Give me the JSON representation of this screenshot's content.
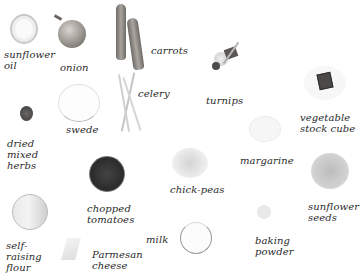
{
  "ingredients": [
    {
      "id": "sunflower-oil",
      "label": "sunflower\noil"
    },
    {
      "id": "onion",
      "label": "onion"
    },
    {
      "id": "carrots",
      "label": "carrots"
    },
    {
      "id": "turnips",
      "label": "turnips"
    },
    {
      "id": "celery",
      "label": "celery"
    },
    {
      "id": "vegetable-stock-cube",
      "label": "vegetable\nstock cube"
    },
    {
      "id": "swede",
      "label": "swede"
    },
    {
      "id": "dried-mixed-herbs",
      "label": "dried\nmixed\nherbs"
    },
    {
      "id": "chopped-tomatoes",
      "label": "chopped\ntomatoes"
    },
    {
      "id": "chick-peas",
      "label": "chick-peas"
    },
    {
      "id": "margarine",
      "label": "margarine"
    },
    {
      "id": "sunflower-seeds",
      "label": "sunflower\nseeds"
    },
    {
      "id": "self-raising-flour",
      "label": "self-\nraising\nflour"
    },
    {
      "id": "milk",
      "label": "milk"
    },
    {
      "id": "baking-powder",
      "label": "baking\npowder"
    },
    {
      "id": "parmesan-cheese",
      "label": "Parmesan\ncheese"
    }
  ],
  "colors": {
    "background": "#ffffff",
    "label_text": "#2a2a2a",
    "tomatoes": "#2b2b2b",
    "herbs": "#4a4a48",
    "carrot": "#8a8580",
    "onion": "#7a7570"
  }
}
